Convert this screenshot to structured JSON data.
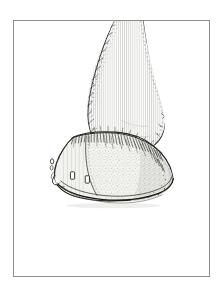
{
  "page": {
    "background_color": "#ffffff",
    "width": 223,
    "height": 300
  },
  "plate": {
    "frame_color": "#8d8d8f",
    "frame_rect": {
      "x": 13,
      "y": 20,
      "width": 197,
      "height": 257
    },
    "background_color": "#ffffff"
  },
  "illustration": {
    "subject": "horse-hoof-and-pastern",
    "technique": "pen-and-ink-line-drawing",
    "ink_color": "#1b1b1b",
    "fill_color": "#f4f4f2",
    "shading_color": "#6f6f6f",
    "view": "lateral-front-three-quarter",
    "cropped_at_frame_top": true,
    "parts": [
      {
        "name": "cannon-and-pastern",
        "label": "pastern",
        "texture": "vertical-hatching"
      },
      {
        "name": "fetlock-joint",
        "label": "fetlock",
        "texture": "stipple-shading"
      },
      {
        "name": "coronet-band",
        "label": "coronet hair fringe",
        "texture": "short-hair-strokes"
      },
      {
        "name": "hoof-wall",
        "label": "hoof wall",
        "texture": "stipple-shading"
      },
      {
        "name": "hoof-toe",
        "label": "toe",
        "texture": "light-wash"
      },
      {
        "name": "heel-bulb",
        "label": "heel",
        "texture": "dense-stipple"
      },
      {
        "name": "horseshoe-rim",
        "label": "shoe",
        "texture": "dark-outline"
      }
    ],
    "nail_clinches": [
      {
        "name": "clinch-left",
        "x": 71,
        "y": 173
      },
      {
        "name": "clinch-right",
        "x": 86,
        "y": 176
      },
      {
        "name": "clinch-toe",
        "x": 52,
        "y": 161
      }
    ]
  }
}
